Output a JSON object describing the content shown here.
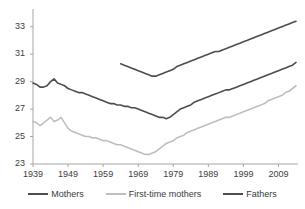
{
  "chart_data": {
    "type": "line",
    "title": "",
    "subtitle": "",
    "xlabel": "",
    "ylabel": "",
    "xlim": [
      1939,
      2014
    ],
    "ylim": [
      23,
      34
    ],
    "grid": false,
    "legend_position": "bottom",
    "xticks": [
      "1939",
      "1949",
      "1959",
      "1969",
      "1979",
      "1989",
      "1999",
      "2009"
    ],
    "xtick_values": [
      1939,
      1949,
      1959,
      1969,
      1979,
      1989,
      1999,
      2009
    ],
    "yticks": [
      "23",
      "25",
      "27",
      "29",
      "31",
      "33"
    ],
    "ytick_values": [
      23,
      25,
      27,
      29,
      31,
      33
    ],
    "colors": {
      "mothers": "#4d4d4d",
      "first_time_mothers": "#bfbfbf",
      "fathers": "#4d4d4d",
      "axis": "#a6a6a6",
      "text": "#404040"
    },
    "series": [
      {
        "name": "Mothers",
        "color": "#4d4d4d",
        "x": [
          1939,
          1940,
          1941,
          1942,
          1943,
          1944,
          1945,
          1946,
          1947,
          1948,
          1949,
          1950,
          1951,
          1952,
          1953,
          1954,
          1955,
          1956,
          1957,
          1958,
          1959,
          1960,
          1961,
          1962,
          1963,
          1964,
          1965,
          1966,
          1967,
          1968,
          1969,
          1970,
          1971,
          1972,
          1973,
          1974,
          1975,
          1976,
          1977,
          1978,
          1979,
          1980,
          1981,
          1982,
          1983,
          1984,
          1985,
          1986,
          1987,
          1988,
          1989,
          1990,
          1991,
          1992,
          1993,
          1994,
          1995,
          1996,
          1997,
          1998,
          1999,
          2000,
          2001,
          2002,
          2003,
          2004,
          2005,
          2006,
          2007,
          2008,
          2009,
          2010,
          2011,
          2012,
          2013,
          2014
        ],
        "y": [
          28.9,
          28.8,
          28.6,
          28.6,
          28.7,
          29.0,
          29.2,
          28.9,
          28.8,
          28.7,
          28.5,
          28.4,
          28.3,
          28.2,
          28.2,
          28.1,
          28.0,
          27.9,
          27.8,
          27.7,
          27.6,
          27.5,
          27.4,
          27.4,
          27.3,
          27.3,
          27.2,
          27.2,
          27.1,
          27.1,
          27.0,
          26.9,
          26.8,
          26.7,
          26.6,
          26.5,
          26.4,
          26.4,
          26.3,
          26.4,
          26.6,
          26.8,
          27.0,
          27.1,
          27.2,
          27.3,
          27.5,
          27.6,
          27.7,
          27.8,
          27.9,
          28.0,
          28.1,
          28.2,
          28.3,
          28.4,
          28.4,
          28.5,
          28.6,
          28.7,
          28.8,
          28.9,
          29.0,
          29.1,
          29.2,
          29.3,
          29.4,
          29.5,
          29.6,
          29.7,
          29.8,
          29.9,
          30.0,
          30.1,
          30.2,
          30.4
        ]
      },
      {
        "name": "First-time mothers",
        "color": "#bfbfbf",
        "x": [
          1939,
          1940,
          1941,
          1942,
          1943,
          1944,
          1945,
          1946,
          1947,
          1948,
          1949,
          1950,
          1951,
          1952,
          1953,
          1954,
          1955,
          1956,
          1957,
          1958,
          1959,
          1960,
          1961,
          1962,
          1963,
          1964,
          1965,
          1966,
          1967,
          1968,
          1969,
          1970,
          1971,
          1972,
          1973,
          1974,
          1975,
          1976,
          1977,
          1978,
          1979,
          1980,
          1981,
          1982,
          1983,
          1984,
          1985,
          1986,
          1987,
          1988,
          1989,
          1990,
          1991,
          1992,
          1993,
          1994,
          1995,
          1996,
          1997,
          1998,
          1999,
          2000,
          2001,
          2002,
          2003,
          2004,
          2005,
          2006,
          2007,
          2008,
          2009,
          2010,
          2011,
          2012,
          2013,
          2014
        ],
        "y": [
          26.1,
          26.0,
          25.8,
          26.0,
          26.2,
          26.4,
          26.1,
          26.2,
          26.4,
          26.0,
          25.6,
          25.4,
          25.3,
          25.2,
          25.1,
          25.0,
          25.0,
          24.9,
          24.9,
          24.8,
          24.7,
          24.7,
          24.6,
          24.5,
          24.4,
          24.4,
          24.3,
          24.2,
          24.1,
          24.0,
          23.9,
          23.8,
          23.7,
          23.7,
          23.8,
          23.9,
          24.1,
          24.3,
          24.5,
          24.6,
          24.7,
          24.9,
          25.0,
          25.1,
          25.3,
          25.4,
          25.5,
          25.6,
          25.7,
          25.8,
          25.9,
          26.0,
          26.1,
          26.2,
          26.3,
          26.4,
          26.4,
          26.5,
          26.6,
          26.7,
          26.8,
          26.9,
          27.0,
          27.1,
          27.2,
          27.3,
          27.4,
          27.6,
          27.7,
          27.8,
          27.9,
          28.0,
          28.2,
          28.3,
          28.5,
          28.7
        ]
      },
      {
        "name": "Fathers",
        "color": "#4d4d4d",
        "x": [
          1964,
          1965,
          1966,
          1967,
          1968,
          1969,
          1970,
          1971,
          1972,
          1973,
          1974,
          1975,
          1976,
          1977,
          1978,
          1979,
          1980,
          1981,
          1982,
          1983,
          1984,
          1985,
          1986,
          1987,
          1988,
          1989,
          1990,
          1991,
          1992,
          1993,
          1994,
          1995,
          1996,
          1997,
          1998,
          1999,
          2000,
          2001,
          2002,
          2003,
          2004,
          2005,
          2006,
          2007,
          2008,
          2009,
          2010,
          2011,
          2012,
          2013,
          2014
        ],
        "y": [
          30.3,
          30.2,
          30.1,
          30.0,
          29.9,
          29.8,
          29.7,
          29.6,
          29.5,
          29.4,
          29.4,
          29.5,
          29.6,
          29.7,
          29.8,
          29.9,
          30.1,
          30.2,
          30.3,
          30.4,
          30.5,
          30.6,
          30.7,
          30.8,
          30.9,
          31.0,
          31.1,
          31.2,
          31.2,
          31.3,
          31.4,
          31.5,
          31.6,
          31.7,
          31.8,
          31.9,
          32.0,
          32.1,
          32.2,
          32.3,
          32.4,
          32.5,
          32.6,
          32.7,
          32.8,
          32.9,
          33.0,
          33.1,
          33.2,
          33.3,
          33.4
        ]
      }
    ]
  },
  "legend": {
    "items": [
      {
        "label": "Mothers",
        "color": "#4d4d4d"
      },
      {
        "label": "First-time mothers",
        "color": "#bfbfbf"
      },
      {
        "label": "Fathers",
        "color": "#4d4d4d"
      }
    ]
  }
}
